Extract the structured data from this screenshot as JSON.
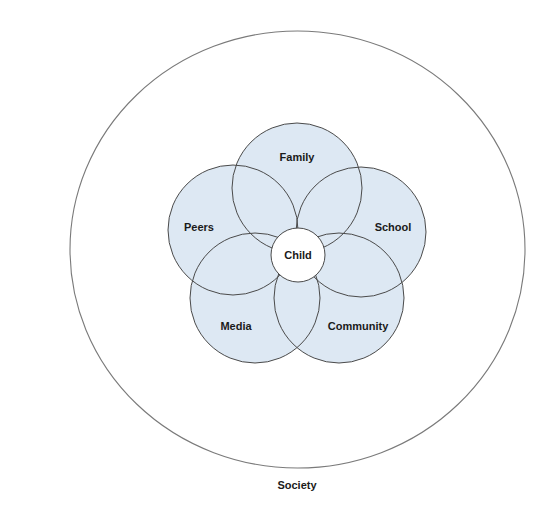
{
  "diagram": {
    "colors": {
      "sphere_fill": "#dde8f3",
      "sphere_stroke": "#4a4a4a",
      "outer_stroke": "#7a7a7a",
      "child_fill": "#ffffff",
      "text": "#1a1a1a"
    },
    "outer": {
      "label": "Society",
      "cx": 297.5,
      "cy": 249.5,
      "rx": 227.5,
      "ry": 218.5,
      "label_x": 297,
      "label_y": 485
    },
    "center": {
      "label": "Child",
      "cx": 298,
      "cy": 255,
      "r": 27
    },
    "spheres": [
      {
        "label": "Family",
        "cx": 297,
        "cy": 188,
        "r": 65,
        "label_x": 297,
        "label_y": 157
      },
      {
        "label": "School",
        "cx": 361,
        "cy": 232,
        "r": 65,
        "label_x": 393,
        "label_y": 227
      },
      {
        "label": "Community",
        "cx": 339,
        "cy": 298,
        "r": 65,
        "label_x": 358,
        "label_y": 326
      },
      {
        "label": "Media",
        "cx": 255,
        "cy": 298,
        "r": 65,
        "label_x": 236,
        "label_y": 326
      },
      {
        "label": "Peers",
        "cx": 233,
        "cy": 230,
        "r": 65,
        "label_x": 199,
        "label_y": 227
      }
    ]
  }
}
